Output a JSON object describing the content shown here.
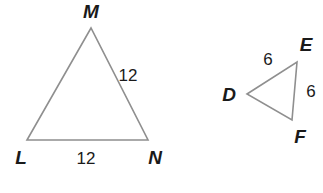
{
  "figure": {
    "background_color": "#ffffff",
    "stroke_color": "#8f8f8f",
    "text_color": "#1a1a1a",
    "stroke_width": 1.6,
    "vertex_font_size": 19,
    "measure_font_size": 17,
    "shapes": [
      {
        "name": "triangle-lmn",
        "vertices": [
          {
            "key": "L",
            "label": "L",
            "x": 27,
            "y": 140,
            "label_x": 21,
            "label_y": 164
          },
          {
            "key": "M",
            "label": "M",
            "x": 91,
            "y": 28,
            "label_x": 91,
            "label_y": 18
          },
          {
            "key": "N",
            "label": "N",
            "x": 148,
            "y": 140,
            "label_x": 155,
            "label_y": 164
          }
        ],
        "measures": [
          {
            "name": "side-mn-length",
            "text": "12",
            "x": 128,
            "y": 81
          },
          {
            "name": "side-ln-length",
            "text": "12",
            "x": 86,
            "y": 164
          }
        ]
      },
      {
        "name": "triangle-def",
        "vertices": [
          {
            "key": "D",
            "label": "D",
            "x": 247,
            "y": 94,
            "label_x": 229,
            "label_y": 101
          },
          {
            "key": "E",
            "label": "E",
            "x": 297,
            "y": 62,
            "label_x": 306,
            "label_y": 51
          },
          {
            "key": "F",
            "label": "F",
            "x": 292,
            "y": 120,
            "label_x": 300,
            "label_y": 143
          }
        ],
        "measures": [
          {
            "name": "side-de-length",
            "text": "6",
            "x": 268,
            "y": 65
          },
          {
            "name": "side-ef-length",
            "text": "6",
            "x": 311,
            "y": 97
          }
        ]
      }
    ]
  }
}
